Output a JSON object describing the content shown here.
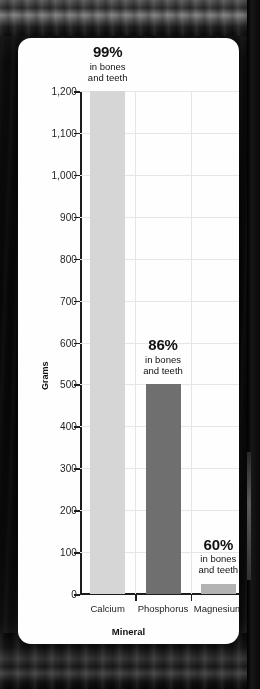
{
  "chart_data": {
    "type": "bar",
    "title": "",
    "xlabel": "Mineral",
    "ylabel": "Grams",
    "categories": [
      "Calcium",
      "Phosphorus",
      "Magnesium"
    ],
    "values": [
      1200,
      500,
      25
    ],
    "ylim": [
      0,
      1200
    ],
    "yticks": [
      0,
      100,
      200,
      300,
      400,
      500,
      600,
      700,
      800,
      900,
      1000,
      1100,
      1200
    ],
    "ytick_labels": [
      "0",
      "100",
      "200",
      "300",
      "400",
      "500",
      "600",
      "700",
      "800",
      "900",
      "1,000",
      "1,100",
      "1,200"
    ],
    "grid": true,
    "legend": "none",
    "bar_colors": [
      "#d6d6d6",
      "#6f6f6f",
      "#b3b3b3"
    ],
    "annotations": [
      {
        "percent": "99%",
        "line1": "in bones",
        "line2": "and teeth"
      },
      {
        "percent": "86%",
        "line1": "in bones",
        "line2": "and teeth"
      },
      {
        "percent": "60%",
        "line1": "in bones",
        "line2": "and teeth"
      }
    ]
  },
  "card": {
    "background_color": "#fefefe",
    "axis_color": "#1d1d1d",
    "grid_color": "#e6e6e6"
  },
  "page": {
    "background_color": "#0a0a0a"
  }
}
